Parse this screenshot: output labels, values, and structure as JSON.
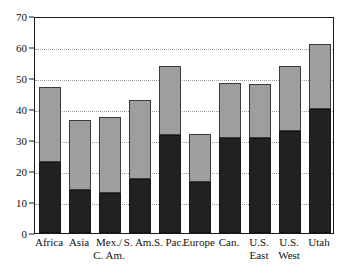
{
  "chart_data": {
    "type": "bar",
    "subtype": "stacked-bar",
    "title": "",
    "subtitle": "",
    "xlabel": "",
    "ylabel": "",
    "ylim": [
      0,
      70
    ],
    "ytick_step": 10,
    "yticks": [
      0,
      10,
      20,
      30,
      40,
      50,
      60,
      70
    ],
    "ytick_labels": [
      "0",
      "10",
      "20",
      "30",
      "40",
      "50",
      "60",
      "70"
    ],
    "grid": true,
    "grid_axis": "y",
    "grid_style": "dotted",
    "legend": false,
    "legend_position": "none",
    "categories": [
      "Africa",
      "Asia",
      "Mex./\nC. Am.",
      "S. Am.",
      "S. Pac.",
      "Europe",
      "Can.",
      "U.S.\nEast",
      "U.S.\nWest",
      "Utah"
    ],
    "series": [
      {
        "name": "lower",
        "color": "#212121",
        "values": [
          23,
          14,
          13,
          17.5,
          31.5,
          16.5,
          30.5,
          30.5,
          33,
          40
        ]
      },
      {
        "name": "upper",
        "color": "#9e9e9e",
        "values": [
          24,
          22.5,
          24.5,
          25.5,
          22.5,
          15.5,
          18,
          17.5,
          21,
          21
        ]
      }
    ],
    "totals": [
      47,
      36.5,
      37.5,
      43,
      54,
      32,
      48.5,
      48,
      54,
      61
    ],
    "colors": {
      "lower_segment": "#212121",
      "upper_segment": "#9e9e9e",
      "axis": "#1a1a1a",
      "gridline": "#9a9a9a",
      "background": "#ffffff"
    }
  }
}
